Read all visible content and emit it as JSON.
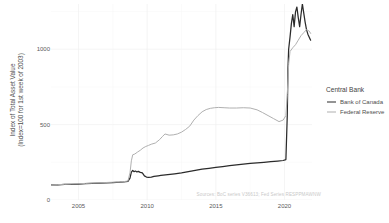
{
  "chart_data": {
    "type": "line",
    "title": "",
    "xlabel": "",
    "ylabel": "Index of Total Asset Value\n(Index=100 for 1st week of 2003)",
    "ylabel_line1": "Index of Total Asset Value",
    "ylabel_line2": "(Index=100 for 1st week of 2003)",
    "caption": "Sources: BoC series V36613; Fed Series RESPPMAWNW",
    "xlim": [
      2003,
      2022
    ],
    "ylim": [
      0,
      1300
    ],
    "yticks": [
      0,
      500,
      1000
    ],
    "ytick_labels": [
      "0",
      "500",
      "1000"
    ],
    "xticks": [
      2005,
      2010,
      2015,
      2020
    ],
    "xtick_labels": [
      "2005",
      "2010",
      "2015",
      "2020"
    ],
    "grid": true,
    "legend_position": "right",
    "legend_title": "Central Bank",
    "series": [
      {
        "name": "Bank of Canada",
        "color": "#2b2b2b",
        "width": 1.25,
        "x": [
          2003.0,
          2003.5,
          2004.0,
          2004.5,
          2005.0,
          2005.5,
          2006.0,
          2006.5,
          2007.0,
          2007.5,
          2008.0,
          2008.3,
          2008.6,
          2008.75,
          2008.85,
          2008.95,
          2009.05,
          2009.15,
          2009.25,
          2009.35,
          2009.5,
          2009.65,
          2009.8,
          2009.95,
          2010.1,
          2010.3,
          2010.5,
          2010.8,
          2011.0,
          2011.5,
          2012.0,
          2012.5,
          2013.0,
          2013.5,
          2014.0,
          2014.5,
          2015.0,
          2015.5,
          2016.0,
          2016.5,
          2017.0,
          2017.5,
          2018.0,
          2018.5,
          2019.0,
          2019.5,
          2019.9,
          2020.1,
          2020.2,
          2020.25,
          2020.3,
          2020.4,
          2020.5,
          2020.6,
          2020.7,
          2020.8,
          2020.9,
          2021.0,
          2021.1,
          2021.2,
          2021.3,
          2021.4,
          2021.5,
          2021.6,
          2021.7,
          2021.8,
          2021.9
        ],
        "y": [
          100,
          101,
          103,
          104,
          106,
          108,
          110,
          112,
          114,
          116,
          118,
          120,
          124,
          145,
          185,
          196,
          188,
          192,
          186,
          190,
          183,
          180,
          160,
          152,
          150,
          152,
          156,
          160,
          163,
          168,
          174,
          180,
          188,
          196,
          204,
          210,
          216,
          222,
          228,
          233,
          238,
          243,
          246,
          250,
          254,
          258,
          262,
          268,
          560,
          870,
          1000,
          1080,
          1170,
          1230,
          1150,
          1248,
          1280,
          1210,
          1150,
          1230,
          1300,
          1240,
          1180,
          1130,
          1100,
          1080,
          1060
        ]
      },
      {
        "name": "Federal Reserve",
        "color": "#b0b0b0",
        "width": 1.0,
        "x": [
          2003.0,
          2003.5,
          2004.0,
          2004.5,
          2005.0,
          2005.5,
          2006.0,
          2006.5,
          2007.0,
          2007.5,
          2008.0,
          2008.3,
          2008.6,
          2008.75,
          2008.85,
          2008.95,
          2009.1,
          2009.3,
          2009.5,
          2009.7,
          2009.9,
          2010.1,
          2010.3,
          2010.6,
          2010.9,
          2011.1,
          2011.3,
          2011.6,
          2011.9,
          2012.2,
          2012.5,
          2012.8,
          2013.1,
          2013.4,
          2013.7,
          2014.0,
          2014.3,
          2014.6,
          2014.9,
          2015.2,
          2015.6,
          2016.0,
          2016.5,
          2017.0,
          2017.5,
          2018.0,
          2018.4,
          2018.8,
          2019.2,
          2019.6,
          2019.9,
          2020.1,
          2020.2,
          2020.3,
          2020.4,
          2020.6,
          2020.8,
          2021.0,
          2021.2,
          2021.4,
          2021.6,
          2021.8,
          2021.9
        ],
        "y": [
          100,
          102,
          104,
          106,
          108,
          110,
          112,
          114,
          116,
          118,
          120,
          122,
          126,
          180,
          260,
          300,
          305,
          318,
          330,
          345,
          355,
          362,
          370,
          378,
          400,
          420,
          438,
          430,
          432,
          438,
          450,
          468,
          490,
          530,
          560,
          585,
          600,
          608,
          612,
          614,
          612,
          610,
          610,
          612,
          610,
          598,
          580,
          560,
          540,
          520,
          530,
          560,
          700,
          900,
          985,
          1010,
          1030,
          1060,
          1090,
          1110,
          1130,
          1120,
          1105
        ]
      }
    ]
  }
}
